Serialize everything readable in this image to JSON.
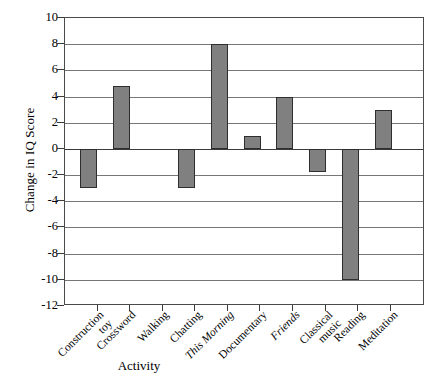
{
  "chart_data": {
    "type": "bar",
    "title": "",
    "xlabel": "Activity",
    "ylabel": "Change in IQ Score",
    "ylim": [
      -12,
      10
    ],
    "ytick_step": 2,
    "grid": true,
    "legend": "none",
    "bar_color": "#808080",
    "bar_edge_color": "#2e2e2e",
    "categories": [
      "Construction toy",
      "Crossword",
      "Walking",
      "Chatting",
      "This Morning",
      "Documentary",
      "Friends",
      "Classical music",
      "Reading",
      "Meditation"
    ],
    "category_lines": [
      [
        "Construction",
        "toy"
      ],
      [
        "Crossword"
      ],
      [
        "Walking"
      ],
      [
        "Chatting"
      ],
      [
        "This Morning"
      ],
      [
        "Documentary"
      ],
      [
        "Friends"
      ],
      [
        "Classical",
        "music"
      ],
      [
        "Reading"
      ],
      [
        "Meditation"
      ]
    ],
    "category_italic": [
      false,
      false,
      false,
      false,
      true,
      false,
      true,
      false,
      false,
      false
    ],
    "values": [
      -3,
      4.8,
      0,
      -3,
      8,
      1,
      4,
      -1.8,
      -10,
      3
    ],
    "ytick_labels": [
      "10",
      "8",
      "6",
      "4",
      "2",
      "0",
      "-2",
      "-4",
      "-6",
      "-8",
      "-10",
      "-12"
    ],
    "ytick_values": [
      10,
      8,
      6,
      4,
      2,
      0,
      -2,
      -4,
      -6,
      -8,
      -10,
      -12
    ]
  }
}
